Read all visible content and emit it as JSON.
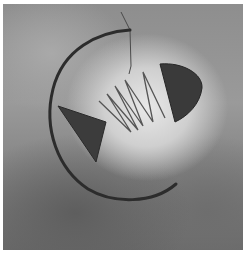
{
  "image": {
    "description": "Black-and-white photograph of a hanging wire mobile sculpture shaped like a fish skeleton against a cloudy gray background",
    "elements": [
      "curved-arc-body",
      "triangular-tail",
      "zigzag-wire-spine",
      "half-disc-head",
      "hanging-wire"
    ],
    "colors": {
      "border": "#ffffff",
      "background_light": "#e0e0e0",
      "background_dark": "#5e5e5e",
      "metal": "#2e2e2e"
    }
  }
}
